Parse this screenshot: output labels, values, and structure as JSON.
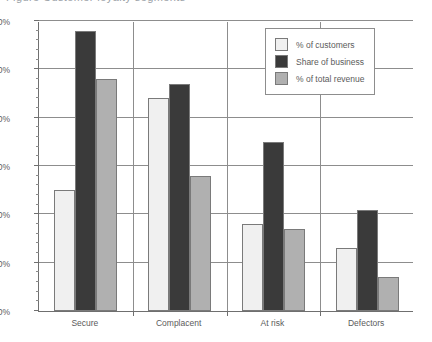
{
  "title_remnant": "Figure  Customer loyalty segments",
  "chart_data": {
    "type": "bar",
    "title": "",
    "xlabel": "",
    "ylabel": "",
    "categories": [
      "Secure",
      "Complacent",
      "At risk",
      "Defectors"
    ],
    "series": [
      {
        "name": "% of customers",
        "color": "#f0f0f0",
        "values": [
          25,
          44,
          18,
          13
        ]
      },
      {
        "name": "Share of business",
        "color": "#3a3a3a",
        "values": [
          58,
          47,
          35,
          21
        ]
      },
      {
        "name": "% of total revenue",
        "color": "#b0b0b0",
        "values": [
          48,
          28,
          17,
          7
        ]
      }
    ],
    "ylim": [
      0,
      60
    ],
    "ytick_labels": [
      "0%",
      "10%",
      "20%",
      "30%",
      "40%",
      "50%",
      "60%"
    ],
    "ytick_values": [
      0,
      10,
      20,
      30,
      40,
      50,
      60
    ],
    "yminor_step": 2,
    "grid": true,
    "legend_position": "top-right",
    "bar_border_color": "#7a7a7a",
    "axis_color": "#6f6f6f",
    "grid_color": "#8d8d8d"
  }
}
